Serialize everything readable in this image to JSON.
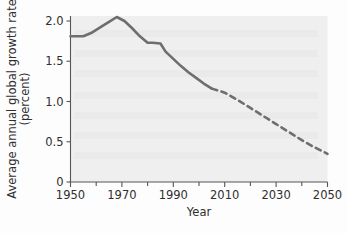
{
  "chart_data": {
    "type": "line",
    "title": "",
    "xlabel": "Year",
    "ylabel": "Average annual global growth rate (percent)",
    "ylabel_line1": "Average annual global growth rate",
    "ylabel_line2": "(percent)",
    "xlim": [
      1950,
      2050
    ],
    "ylim": [
      0,
      2.1
    ],
    "grid": false,
    "legend": "none",
    "xticks": [
      1950,
      1970,
      1990,
      2010,
      2030,
      2050
    ],
    "xtick_labels": [
      "1950",
      "1970",
      "1990",
      "2010",
      "2030",
      "2050"
    ],
    "xminor_ticks": [
      1960,
      1980,
      2000,
      2020,
      2040
    ],
    "yticks": [
      0,
      0.5,
      1.0,
      1.5,
      2.0
    ],
    "ytick_labels": [
      "0",
      "0.5",
      "1.0",
      "1.5",
      "2.0"
    ],
    "line_color": "#6e6e6e",
    "plot_background": "#efefef",
    "series": [
      {
        "name": "Observed growth rate",
        "style": "solid",
        "x": [
          1950,
          1955,
          1958,
          1962,
          1965,
          1968,
          1971,
          1974,
          1977,
          1980,
          1982,
          1985,
          1987,
          1990,
          1993,
          1996,
          1999,
          2002,
          2005
        ],
        "values": [
          1.81,
          1.81,
          1.85,
          1.93,
          1.99,
          2.05,
          2.0,
          1.91,
          1.81,
          1.73,
          1.73,
          1.72,
          1.62,
          1.53,
          1.44,
          1.36,
          1.29,
          1.22,
          1.16
        ]
      },
      {
        "name": "Projected growth rate",
        "style": "dashed",
        "x": [
          2005,
          2010,
          2015,
          2020,
          2025,
          2030,
          2035,
          2040,
          2045,
          2050
        ],
        "values": [
          1.16,
          1.11,
          1.02,
          0.92,
          0.82,
          0.72,
          0.62,
          0.52,
          0.43,
          0.35
        ]
      }
    ]
  }
}
